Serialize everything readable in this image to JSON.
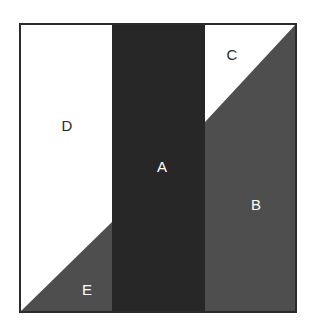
{
  "figure": {
    "canvas": {
      "width": 317,
      "height": 333
    },
    "background_color": "#ffffff",
    "border_color": "#2b2b2b",
    "border_width": 2,
    "square": {
      "left": 20,
      "top": 24,
      "right": 296,
      "bottom": 312
    },
    "colors": {
      "dark": "#272727",
      "gray": "#4e4e4e",
      "white": "#ffffff",
      "label_light": "#ffffff",
      "label_dark": "#2b2b2b",
      "outline": "#2b2b2b"
    },
    "regions": [
      {
        "id": "region-a",
        "label": "A",
        "fill": "#272727",
        "label_color": "#ffffff",
        "label_x": 162,
        "label_y": 166,
        "points": "112,24 205,24 205,312 112,312",
        "description": "dark vertical band in the middle"
      },
      {
        "id": "region-b",
        "label": "B",
        "fill": "#4e4e4e",
        "label_color": "#ffffff",
        "label_x": 256,
        "label_y": 204,
        "points": "205,122 296,24 296,312 205,312",
        "description": "gray region on the right below the diagonal"
      },
      {
        "id": "region-c",
        "label": "C",
        "fill": "#ffffff",
        "label_color": "#2b2b2b",
        "label_x": 232,
        "label_y": 54,
        "points": "205,24 296,24 205,122",
        "description": "white triangle at top right"
      },
      {
        "id": "region-d",
        "label": "D",
        "fill": "#ffffff",
        "label_color": "#2b2b2b",
        "label_x": 67,
        "label_y": 125,
        "points": "20,24 112,24 112,222 20,312",
        "description": "white region on the left above the diagonal"
      },
      {
        "id": "region-e",
        "label": "E",
        "fill": "#4e4e4e",
        "label_color": "#ffffff",
        "label_x": 87,
        "label_y": 289,
        "points": "20,312 112,222 112,312",
        "description": "gray triangle at bottom left"
      }
    ],
    "edges": [
      {
        "id": "edge-outer-square",
        "kind": "rect"
      },
      {
        "id": "edge-a-left",
        "kind": "vertical",
        "x": 112
      },
      {
        "id": "edge-a-right",
        "kind": "vertical",
        "x": 205
      },
      {
        "id": "edge-d-e-diagonal",
        "kind": "diagonal"
      },
      {
        "id": "edge-c-b-diagonal",
        "kind": "diagonal"
      }
    ]
  }
}
